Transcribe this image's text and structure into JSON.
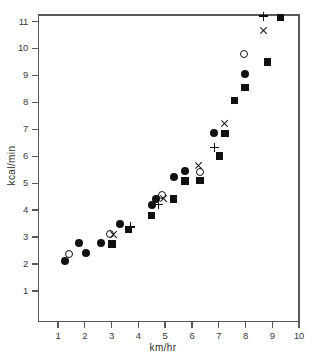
{
  "chart_data": {
    "type": "scatter",
    "title": "",
    "xlabel": "km/hr",
    "ylabel": "kcal/min",
    "xlim": [
      0.55,
      10.0
    ],
    "ylim": [
      0.3,
      11.6
    ],
    "xticks": [
      1,
      2,
      3,
      4,
      5,
      6,
      7,
      8,
      9,
      10
    ],
    "xtick_labels": [
      "1",
      "2",
      "3",
      "4",
      "5",
      "6",
      "7",
      "8",
      "9",
      "10"
    ],
    "yticks": [
      1,
      2,
      3,
      4,
      5,
      6,
      7,
      8,
      9,
      10,
      11
    ],
    "ytick_labels": [
      "1",
      "2",
      "3",
      "4",
      "5",
      "6",
      "7",
      "8",
      "9",
      "10",
      "11"
    ],
    "grid": false,
    "legend": "none",
    "marker_color": "#111111",
    "axis_color": "#555a5e",
    "series": [
      {
        "name": "filled-circle",
        "marker": "filled-circle",
        "points": [
          [
            1.28,
            2.1
          ],
          [
            1.8,
            2.77
          ],
          [
            2.04,
            2.42
          ],
          [
            2.62,
            2.79
          ],
          [
            3.32,
            3.5
          ],
          [
            4.5,
            4.18
          ],
          [
            4.66,
            4.42
          ],
          [
            5.32,
            5.24
          ],
          [
            5.74,
            5.47
          ],
          [
            6.84,
            6.85
          ],
          [
            7.98,
            9.06
          ]
        ]
      },
      {
        "name": "filled-square",
        "marker": "filled-square",
        "points": [
          [
            3.02,
            2.74
          ],
          [
            3.64,
            3.28
          ],
          [
            4.5,
            3.8
          ],
          [
            5.32,
            4.42
          ],
          [
            5.74,
            5.08
          ],
          [
            6.3,
            5.1
          ],
          [
            7.02,
            6.01
          ],
          [
            7.24,
            6.85
          ],
          [
            7.58,
            8.07
          ],
          [
            7.98,
            8.55
          ],
          [
            8.82,
            9.5
          ],
          [
            9.3,
            11.15
          ]
        ]
      },
      {
        "name": "open-circle",
        "marker": "open-circle",
        "points": [
          [
            1.4,
            2.36
          ],
          [
            2.96,
            3.1
          ],
          [
            4.9,
            4.56
          ],
          [
            6.32,
            5.4
          ],
          [
            7.96,
            9.79
          ]
        ]
      },
      {
        "name": "plus",
        "marker": "plus",
        "points": [
          [
            3.7,
            3.38
          ],
          [
            4.76,
            4.22
          ],
          [
            6.84,
            6.33
          ],
          [
            8.68,
            11.2
          ]
        ]
      },
      {
        "name": "cross",
        "marker": "cross",
        "points": [
          [
            3.08,
            3.08
          ],
          [
            4.94,
            4.45
          ],
          [
            6.26,
            5.64
          ],
          [
            7.22,
            7.21
          ],
          [
            8.7,
            10.66
          ]
        ]
      }
    ]
  }
}
